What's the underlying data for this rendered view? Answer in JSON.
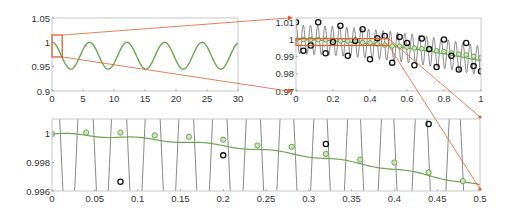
{
  "chart_data": [
    {
      "id": "overview",
      "type": "line",
      "title": "",
      "xlabel": "",
      "ylabel": "",
      "xlim": [
        0,
        30
      ],
      "ylim": [
        0.9,
        1.05
      ],
      "xticks": [
        "0",
        "5",
        "10",
        "15",
        "20",
        "25",
        "30"
      ],
      "yticks": [
        "0.9",
        "0.95",
        "1",
        "1.05"
      ],
      "series": [
        {
          "name": "smooth solution",
          "color": "#6aa84f",
          "description": "cosine-like oscillation between ~0.945 and 1.0, period ~6",
          "x": [
            0,
            1.5,
            3,
            4.5,
            6,
            7.5,
            9,
            10.5,
            12,
            13.5,
            15,
            16.5,
            18,
            19.5,
            21,
            22.5,
            24,
            25.5,
            27,
            28.5,
            30
          ],
          "values": [
            1.0,
            0.9725,
            0.945,
            0.9725,
            1.0,
            0.9725,
            0.945,
            0.9725,
            1.0,
            0.9725,
            0.945,
            0.9725,
            1.0,
            0.9725,
            0.945,
            0.9725,
            1.0,
            0.9725,
            0.945,
            0.9725,
            1.0
          ]
        }
      ],
      "annotations": [
        {
          "type": "zoom-box",
          "color": "#e06030",
          "x": [
            0,
            1
          ],
          "y": [
            0.97,
            1.015
          ],
          "links_to": "zoom1"
        }
      ],
      "grid": false
    },
    {
      "id": "zoom1",
      "type": "line",
      "title": "",
      "xlim": [
        0,
        1
      ],
      "ylim": [
        0.97,
        1.01
      ],
      "xticks": [
        "0",
        "0.2",
        "0.4",
        "0.6",
        "0.8",
        "1"
      ],
      "yticks": [
        "0.97",
        "0.98",
        "0.99",
        "1",
        "1.01"
      ],
      "series": [
        {
          "name": "fast oscillation",
          "color": "#555555",
          "description": "high-frequency oscillation (~25 cycles on [0,1]) with amplitude ~0.008, slowly drifting downward"
        },
        {
          "name": "smooth (green circles)",
          "color": "#6aa84f",
          "marker": "circle",
          "x": [
            0,
            0.04,
            0.08,
            0.12,
            0.16,
            0.2,
            0.24,
            0.28,
            0.32,
            0.36,
            0.4,
            0.44,
            0.48,
            0.52,
            0.56,
            0.6,
            0.64,
            0.68,
            0.72,
            0.76,
            0.8,
            0.84,
            0.88,
            0.92,
            0.96,
            1.0
          ],
          "values": [
            1.0,
            1.0,
            1.0,
            0.9999,
            0.9998,
            0.9996,
            0.9992,
            0.9991,
            0.9986,
            0.9982,
            0.998,
            0.9973,
            0.9967,
            0.9962,
            0.996,
            0.9955,
            0.995,
            0.9946,
            0.994,
            0.9934,
            0.993,
            0.9922,
            0.9915,
            0.991,
            0.9902,
            0.9895
          ]
        },
        {
          "name": "sampled (black circles)",
          "color": "#111111",
          "marker": "circle",
          "x": [
            0,
            0.04,
            0.08,
            0.12,
            0.16,
            0.2,
            0.24,
            0.28,
            0.32,
            0.36,
            0.4,
            0.44,
            0.48,
            0.52,
            0.56,
            0.6,
            0.64,
            0.68,
            0.72,
            0.76,
            0.8,
            0.84,
            0.88,
            0.92,
            0.96,
            1.0
          ],
          "values": [
            1.01,
            0.9935,
            0.9965,
            1.01,
            0.992,
            0.9985,
            1.008,
            0.9905,
            0.9993,
            1.006,
            0.9885,
            1.0007,
            1.002,
            0.9865,
            1.0015,
            0.998,
            0.985,
            1.0005,
            0.9945,
            0.984,
            1.0,
            0.9905,
            0.9825,
            0.998,
            0.9845,
            0.9815
          ]
        }
      ],
      "annotations": [
        {
          "type": "zoom-box",
          "color": "#e06030",
          "x": [
            0,
            0.5
          ],
          "y": [
            0.9965,
            1.0005
          ],
          "links_to": "zoom2"
        }
      ],
      "grid": false
    },
    {
      "id": "zoom2",
      "type": "line",
      "title": "",
      "xlim": [
        0,
        0.5
      ],
      "ylim": [
        0.996,
        1.001
      ],
      "xticks": [
        "0",
        "0.05",
        "0.1",
        "0.15",
        "0.2",
        "0.25",
        "0.3",
        "0.35",
        "0.4",
        "0.45",
        "0.5"
      ],
      "yticks": [
        "0.996",
        "0.998",
        "1"
      ],
      "series": [
        {
          "name": "fast oscillation",
          "color": "#555555",
          "description": "steep near-vertical line segments crossing the window, ~every 0.02-0.04 in x"
        },
        {
          "name": "smooth (green circles)",
          "color": "#6aa84f",
          "marker": "circle",
          "x": [
            0,
            0.04,
            0.08,
            0.12,
            0.16,
            0.2,
            0.24,
            0.28,
            0.32,
            0.36,
            0.4,
            0.44,
            0.48
          ],
          "values": [
            1.0,
            1.0001,
            1.0001,
            0.9999,
            0.9998,
            0.9996,
            0.9992,
            0.9991,
            0.9986,
            0.9982,
            0.998,
            0.9973,
            0.9967
          ]
        },
        {
          "name": "sampled (black circles)",
          "color": "#111111",
          "marker": "circle",
          "x": [
            0.08,
            0.2,
            0.32,
            0.44
          ],
          "values": [
            0.99665,
            0.9985,
            0.9993,
            1.0007
          ]
        }
      ],
      "grid": false
    }
  ]
}
